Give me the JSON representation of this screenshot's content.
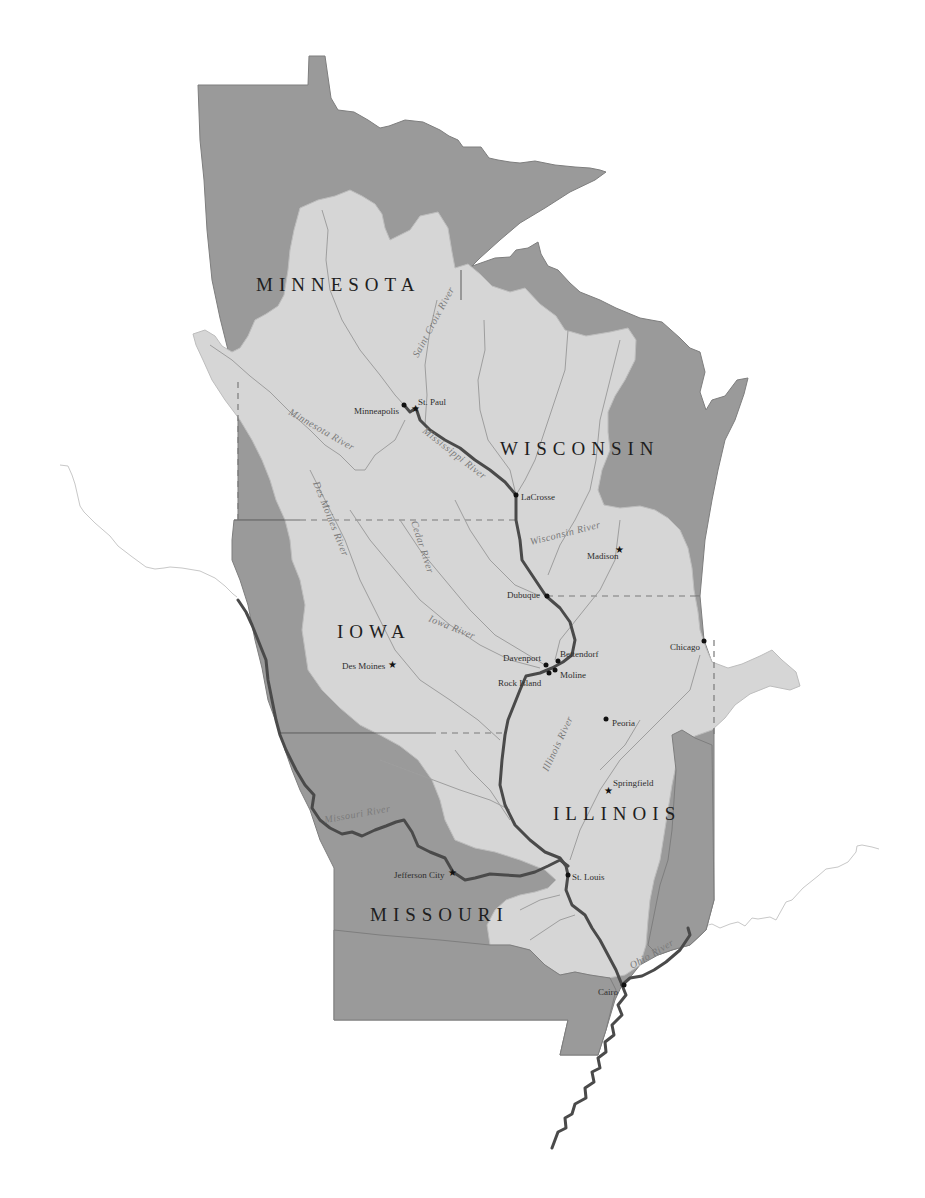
{
  "map": {
    "title": "Upper Mississippi River Basin",
    "colors": {
      "state_fill": "#9a9a9a",
      "basin_fill": "#d6d6d6",
      "main_river": "#4a4a4a",
      "tributary": "#9e9e9e",
      "background": "#ffffff"
    },
    "states": [
      {
        "name": "MINNESOTA",
        "x": 256,
        "y": 291
      },
      {
        "name": "WISCONSIN",
        "x": 500,
        "y": 455
      },
      {
        "name": "IOWA",
        "x": 337,
        "y": 638
      },
      {
        "name": "ILLINOIS",
        "x": 553,
        "y": 820
      },
      {
        "name": "MISSOURI",
        "x": 370,
        "y": 921
      }
    ],
    "cities": [
      {
        "name": "Minneapolis",
        "type": "city",
        "x": 404,
        "y": 405,
        "label_x": 354,
        "label_y": 414
      },
      {
        "name": "St. Paul",
        "type": "capital",
        "x": 416,
        "y": 408,
        "label_x": 418,
        "label_y": 405
      },
      {
        "name": "LaCrosse",
        "type": "city",
        "x": 516,
        "y": 495,
        "label_x": 521,
        "label_y": 500
      },
      {
        "name": "Madison",
        "type": "capital",
        "x": 620,
        "y": 549,
        "label_x": 587,
        "label_y": 559
      },
      {
        "name": "Dubuque",
        "type": "city",
        "x": 547,
        "y": 596,
        "label_x": 507,
        "label_y": 596
      },
      {
        "name": "Chicago",
        "type": "city",
        "x": 704,
        "y": 641,
        "label_x": 670,
        "label_y": 650
      },
      {
        "name": "Davenport",
        "type": "city",
        "x": 546,
        "y": 665,
        "label_x": 503,
        "label_y": 661
      },
      {
        "name": "Bettendorf",
        "type": "city",
        "x": 558,
        "y": 661,
        "label_x": 560,
        "label_y": 657
      },
      {
        "name": "Moline",
        "type": "city",
        "x": 555,
        "y": 670,
        "label_x": 560,
        "label_y": 678
      },
      {
        "name": "Rock Island",
        "type": "city",
        "x": 549,
        "y": 673,
        "label_x": 498,
        "label_y": 686
      },
      {
        "name": "Des Moines",
        "type": "capital",
        "x": 393,
        "y": 664,
        "label_x": 342,
        "label_y": 669
      },
      {
        "name": "Peoria",
        "type": "city",
        "x": 606,
        "y": 719,
        "label_x": 612,
        "label_y": 726
      },
      {
        "name": "Springfield",
        "type": "capital",
        "x": 609,
        "y": 790,
        "label_x": 613,
        "label_y": 786
      },
      {
        "name": "Jefferson City",
        "type": "capital",
        "x": 453,
        "y": 872,
        "label_x": 394,
        "label_y": 878
      },
      {
        "name": "St. Louis",
        "type": "city",
        "x": 568,
        "y": 875,
        "label_x": 572,
        "label_y": 880
      },
      {
        "name": "Cairo",
        "type": "city",
        "x": 624,
        "y": 985,
        "label_x": 598,
        "label_y": 995
      }
    ],
    "rivers": [
      {
        "name": "Saint Croix River",
        "x": 418,
        "y": 350,
        "rotate": -62
      },
      {
        "name": "Minnesota River",
        "x": 285,
        "y": 416,
        "rotate": 30
      },
      {
        "name": "Mississippi River",
        "x": 422,
        "y": 432,
        "rotate": 38
      },
      {
        "name": "Des Moines River",
        "x": 313,
        "y": 483,
        "rotate": 68
      },
      {
        "name": "Cedar River",
        "x": 409,
        "y": 526,
        "rotate": 72
      },
      {
        "name": "Wisconsin River",
        "x": 531,
        "y": 541,
        "rotate": -14
      },
      {
        "name": "Iowa River",
        "x": 428,
        "y": 623,
        "rotate": 22
      },
      {
        "name": "Illinois River",
        "x": 548,
        "y": 768,
        "rotate": -65
      },
      {
        "name": "Missouri River",
        "x": 325,
        "y": 821,
        "rotate": -10
      },
      {
        "name": "Ohio River",
        "x": 632,
        "y": 967,
        "rotate": -30
      }
    ]
  }
}
